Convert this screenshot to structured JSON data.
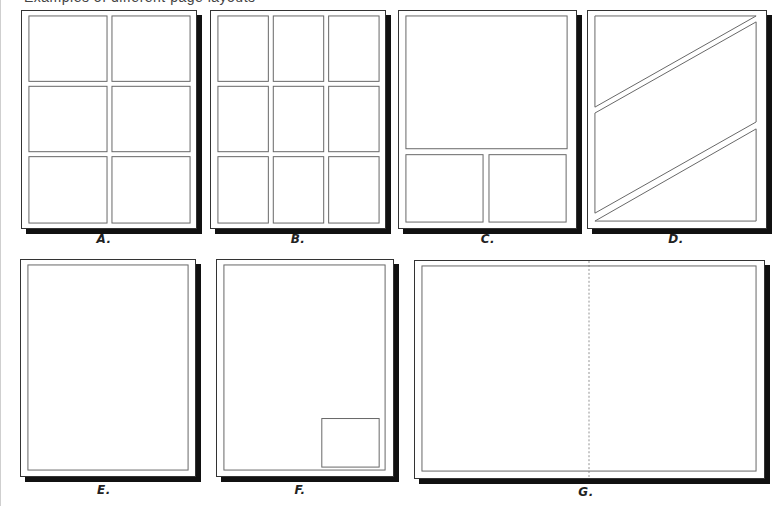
{
  "caption_cropped": "Examples of different page layouts",
  "layouts": [
    {
      "id": "A",
      "label": "A.",
      "description": "six-panel grid, 2 columns x 3 rows"
    },
    {
      "id": "B",
      "label": "B.",
      "description": "nine-panel grid, 3 columns x 3 rows"
    },
    {
      "id": "C",
      "label": "C.",
      "description": "large top panel with two panels below"
    },
    {
      "id": "D",
      "label": "D.",
      "description": "three panels separated by diagonal gutters"
    },
    {
      "id": "E",
      "label": "E.",
      "description": "single full-page splash panel"
    },
    {
      "id": "F",
      "label": "F.",
      "description": "splash panel with small inset panel bottom-right"
    },
    {
      "id": "G",
      "label": "G.",
      "description": "double-page spread splash with dashed center fold"
    }
  ],
  "colors": {
    "frame": "#333333",
    "panel_line": "#666666",
    "shadow": "#111111",
    "fold_line": "#777777"
  }
}
